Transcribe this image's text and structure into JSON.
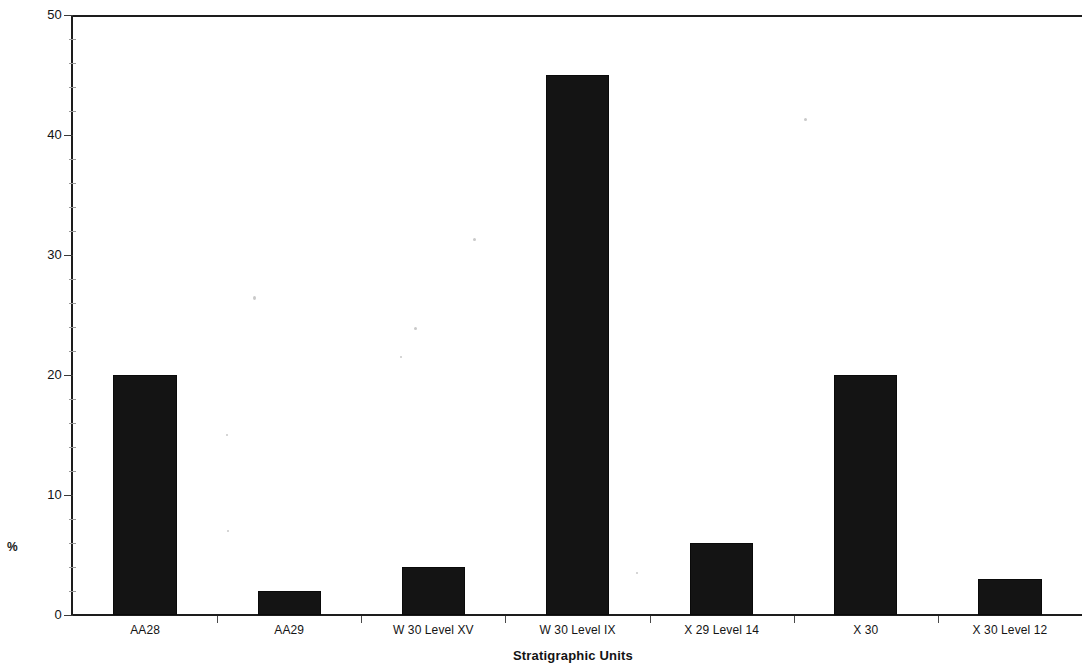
{
  "chart_data": {
    "type": "bar",
    "title": "",
    "xlabel": "Stratigraphic Units",
    "ylabel": "%",
    "categories": [
      "AA28",
      "AA29",
      "W 30 Level XV",
      "W 30 Level IX",
      "X 29 Level 14",
      "X 30",
      "X 30 Level 12"
    ],
    "values": [
      20,
      2,
      4,
      45,
      6,
      20,
      3
    ],
    "ylim": [
      0,
      50
    ],
    "ytick_labels": [
      "0",
      "10",
      "20",
      "30",
      "40",
      "50"
    ],
    "ytick_values": [
      0,
      10,
      20,
      30,
      40,
      50
    ],
    "minor_ticks_per_interval": 5,
    "grid": false,
    "legend": false,
    "bar_color": "#141414",
    "axis_color": "#1d1d1d",
    "background_color": "#ffffff"
  },
  "axes": {
    "y_title": "%",
    "x_title": "Stratigraphic Units"
  }
}
